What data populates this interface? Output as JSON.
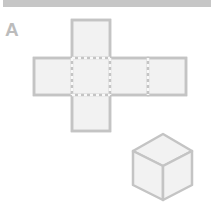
{
  "header_bar": {
    "color": "#c6c6c6"
  },
  "figure": {
    "label": "A",
    "net": {
      "faces": 6,
      "layout": "cross",
      "face_fill": "#f2f2f2",
      "edge_color": "#c4c4c4",
      "fold_line_style": "dashed"
    },
    "cube": {
      "face_fill": "#f2f2f2",
      "edge_color": "#c4c4c4"
    }
  }
}
